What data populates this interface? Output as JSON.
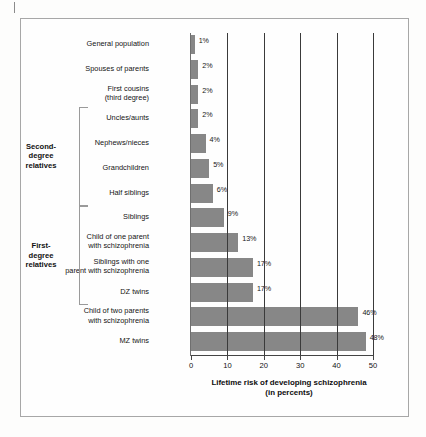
{
  "figure": {
    "background_color": "#fdfdfc",
    "frame_color": "#a7a7a7",
    "bar_color": "#878787",
    "grid_color": "#3a3a3a",
    "axis_title_line1": "Lifetime risk of developing schizophrenia",
    "axis_title_line2": "(in percents)"
  },
  "brackets": [
    {
      "label": "Second-\ndegree\nrelatives"
    },
    {
      "label": "First-\ndegree\nrelatives"
    }
  ],
  "chart_data": {
    "type": "bar",
    "orientation": "horizontal",
    "title": "",
    "xlabel": "Lifetime risk of developing schizophrenia (in percents)",
    "ylabel": "",
    "xlim": [
      0,
      50
    ],
    "xticks": [
      0,
      10,
      20,
      30,
      40,
      50
    ],
    "xtick_labels": [
      "0",
      "10",
      "20",
      "30",
      "40",
      "50"
    ],
    "grid": true,
    "grid_axis": "x",
    "legend": false,
    "value_suffix": "%",
    "categories": [
      "General population",
      "Spouses of parents",
      "First cousins\n(third degree)",
      "Uncles/aunts",
      "Nephews/nieces",
      "Grandchildren",
      "Half siblings",
      "Siblings",
      "Child of one parent\nwith schizophrenia",
      "Siblings with one\nparent with schizophrenia",
      "DZ twins",
      "Child of two parents\nwith schizophrenia",
      "MZ twins"
    ],
    "values": [
      1,
      2,
      2,
      2,
      4,
      5,
      6,
      9,
      13,
      17,
      17,
      46,
      48
    ],
    "data_labels": [
      "1%",
      "2%",
      "2%",
      "2%",
      "4%",
      "5%",
      "6%",
      "9%",
      "13%",
      "17%",
      "17%",
      "46%",
      "48%"
    ],
    "annotations": [
      {
        "text": "Second-degree relatives",
        "covers": [
          "Uncles/aunts",
          "Nephews/nieces",
          "Grandchildren",
          "Half siblings"
        ]
      },
      {
        "text": "First-degree relatives",
        "covers": [
          "Siblings",
          "Child of one parent with schizophrenia",
          "Siblings with one parent with schizophrenia",
          "DZ twins"
        ]
      }
    ]
  }
}
